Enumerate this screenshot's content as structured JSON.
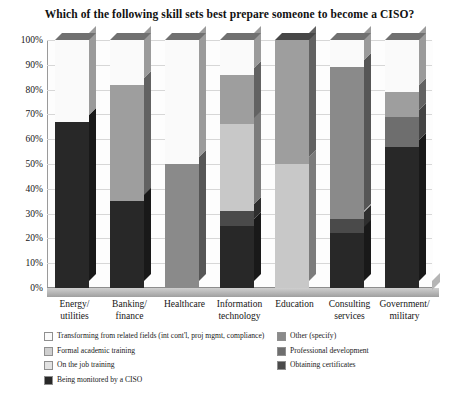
{
  "chart_data": {
    "type": "bar",
    "subtype": "stacked-column-100-3d",
    "title": "Which of the following skill sets best prepare someone to become a CISO?",
    "xlabel": "",
    "ylabel": "",
    "ylim": [
      0,
      100
    ],
    "yticks": [
      "0%",
      "10%",
      "20%",
      "30%",
      "40%",
      "50%",
      "60%",
      "70%",
      "80%",
      "90%",
      "100%"
    ],
    "grid": true,
    "legend_position": "bottom",
    "categories": [
      "Energy/\nutilities",
      "Banking/\nfinance",
      "Healthcare",
      "Information\ntechnology",
      "Education",
      "Consulting\nservices",
      "Government/\nmilitary"
    ],
    "category_labels": [
      [
        "Energy/",
        "utilities"
      ],
      [
        "Banking/",
        "finance"
      ],
      [
        "Healthcare",
        ""
      ],
      [
        "Information",
        "technology"
      ],
      [
        "Education",
        ""
      ],
      [
        "Consulting",
        "services"
      ],
      [
        "Government/",
        "military"
      ]
    ],
    "series": [
      {
        "name": "Being monitored by a CISO",
        "color": "#282828",
        "values": [
          67,
          35,
          0,
          25,
          0,
          22,
          57
        ]
      },
      {
        "name": "Obtaining certificates",
        "color": "#4a4a4a",
        "values": [
          0,
          0,
          0,
          6,
          0,
          6,
          0
        ]
      },
      {
        "name": "Professional development",
        "color": "#6e6e6e",
        "values": [
          0,
          0,
          0,
          0,
          0,
          0,
          12
        ]
      },
      {
        "name": "Other (specify)",
        "color": "#8a8a8a",
        "values": [
          0,
          0,
          50,
          0,
          0,
          61,
          0
        ]
      },
      {
        "name": "On the job training",
        "color": "#c8c8c8",
        "values": [
          0,
          0,
          0,
          35,
          50,
          0,
          0
        ]
      },
      {
        "name": "Formal academic training",
        "color": "#9e9e9e",
        "values": [
          0,
          47,
          0,
          20,
          50,
          0,
          10
        ]
      },
      {
        "name": "Transforming from related fields (int cont'l, proj mgmt, compliance)",
        "color": "#fafafa",
        "values": [
          33,
          18,
          50,
          14,
          0,
          11,
          21
        ]
      }
    ]
  },
  "legend": {
    "left_items": [
      {
        "label": "Transforming from related fields (int cont'l, proj mgmt, compliance)",
        "color": "#fafafa"
      },
      {
        "label": "Formal academic training",
        "color": "#cfcfcf"
      },
      {
        "label": "On the job training",
        "color": "#e2e2e2"
      },
      {
        "label": "Being monitored by a CISO",
        "color": "#282828"
      }
    ],
    "right_items": [
      {
        "label": "Other (specify)",
        "color": "#8a8a8a"
      },
      {
        "label": "Professional development",
        "color": "#6e6e6e"
      },
      {
        "label": "Obtaining certificates",
        "color": "#4a4a4a"
      }
    ]
  }
}
